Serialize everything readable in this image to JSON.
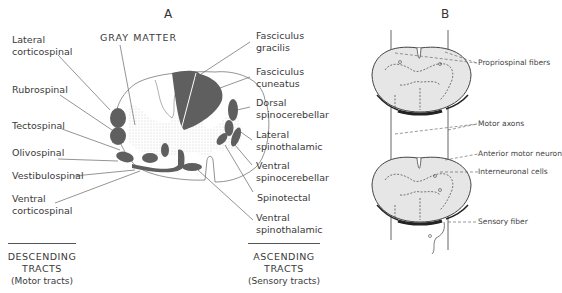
{
  "panel_a": {
    "title": "A",
    "gray_matter_label": "GRAY MATTER",
    "descending_labels": [
      {
        "line1": "Lateral",
        "line2": "corticospinal"
      },
      {
        "line1": "Rubrospinal",
        "line2": ""
      },
      {
        "line1": "Tectospinal",
        "line2": ""
      },
      {
        "line1": "Olivospinal",
        "line2": ""
      },
      {
        "line1": "Vestibulospinal",
        "line2": ""
      },
      {
        "line1": "Ventral",
        "line2": "corticospinal"
      }
    ],
    "ascending_labels": [
      {
        "line1": "Fasciculus",
        "line2": "gracilis"
      },
      {
        "line1": "Fasciculus",
        "line2": "cuneatus"
      },
      {
        "line1": "Dorsal",
        "line2": "spinocerebellar"
      },
      {
        "line1": "Lateral",
        "line2": "spinothalamic"
      },
      {
        "line1": "Ventral",
        "line2": "spinocerebellar"
      },
      {
        "line1": "Spinotectal",
        "line2": ""
      },
      {
        "line1": "Ventral",
        "line2": "spinothalamic"
      }
    ],
    "descending_footer": {
      "line1": "DESCENDING",
      "line2": "TRACTS",
      "line3": "(Motor tracts)"
    },
    "ascending_footer": {
      "line1": "ASCENDING",
      "line2": "TRACTS",
      "line3": "(Sensory tracts)"
    }
  },
  "panel_b": {
    "title": "B",
    "labels": {
      "propriospinal": "Propriospinal fibers",
      "motor_axons": "Motor axons",
      "anterior_motor_neuron": "Anterior motor neuron",
      "interneuronal": "Interneuronal cells",
      "sensory_fiber": "Sensory fiber"
    }
  },
  "colors": {
    "tract_fill": "#5f5f5f",
    "outline": "#555555",
    "section_fill": "#e6e6e6",
    "text": "#3a3a3a"
  }
}
